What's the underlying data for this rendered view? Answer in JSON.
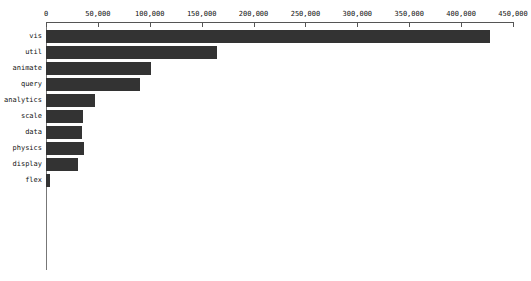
{
  "chart_data": {
    "type": "bar",
    "orientation": "horizontal",
    "title": "",
    "subtitle": "",
    "xlabel": "",
    "ylabel": "",
    "categories": [
      "vis",
      "util",
      "animate",
      "query",
      "analytics",
      "scale",
      "data",
      "physics",
      "display",
      "flex"
    ],
    "values": [
      428000,
      165000,
      101000,
      91000,
      47000,
      36000,
      35000,
      37000,
      31000,
      4000
    ],
    "series": [
      {
        "name": "size",
        "values": [
          428000,
          165000,
          101000,
          91000,
          47000,
          36000,
          35000,
          37000,
          31000,
          4000
        ]
      }
    ],
    "xlim": [
      0,
      450000
    ],
    "xticks": [
      0,
      50000,
      100000,
      150000,
      200000,
      250000,
      300000,
      350000,
      400000,
      450000
    ],
    "xtick_labels": [
      "0",
      "50,000",
      "100,000",
      "150,000",
      "200,000",
      "250,000",
      "300,000",
      "350,000",
      "400,000",
      "450,000"
    ],
    "grid": false,
    "legend": "none",
    "bar_color": "#333333",
    "axis_color": "#555555",
    "background": "#ffffff",
    "x_axis_position": "top"
  }
}
